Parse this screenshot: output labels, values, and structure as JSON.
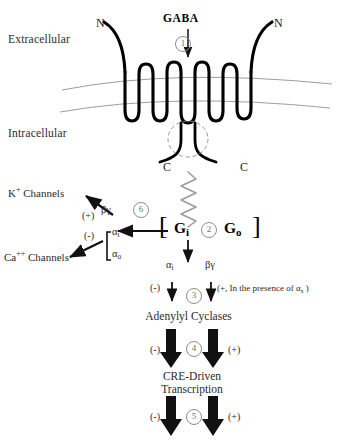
{
  "figure": {
    "type": "signaling-pathway-diagram"
  },
  "compartments": {
    "extracellular_label": "Extracellular",
    "intracellular_label": "Intracellular"
  },
  "ligand": {
    "name": "GABA"
  },
  "receptor": {
    "n_terminus_left": "N",
    "n_terminus_right": "N",
    "c_terminus_left": "C",
    "c_terminus_right": "C",
    "transmembrane_helices": 7
  },
  "gprotein": {
    "bracket_open": "[",
    "bracket_close": "]",
    "left_label": "G",
    "left_subscript": "i",
    "right_label": "G",
    "right_subscript": "o"
  },
  "channels": {
    "potassium": {
      "name": "K",
      "charge": "+",
      "suffix": " Channels",
      "full": "K+ Channels",
      "effect_sign": "(+)",
      "mediator": "βγ"
    },
    "calcium": {
      "name": "Ca",
      "charge": "++",
      "suffix": " Channels",
      "full": "Ca++ Channels",
      "effect_sign": "(-)",
      "mediator_alpha_i": "α",
      "mediator_alpha_i_sub": "i",
      "mediator_alpha_o": "α",
      "mediator_alpha_o_sub": "o"
    }
  },
  "cascade": {
    "alpha_i": {
      "symbol": "α",
      "sub": "i"
    },
    "beta_gamma": {
      "symbol": "βγ"
    },
    "alpha_i_sign": "(-)",
    "beta_gamma_note": "(+, In the presence of α",
    "beta_gamma_note_sub": "s",
    "beta_gamma_note_close": " )",
    "adenylyl_cyclases": "Adenylyl Cyclases",
    "ac_left_sign": "(-)",
    "ac_right_sign": "(+)",
    "cre_line1": "CRE-Driven",
    "cre_line2": "Transcription",
    "cre_left_sign": "(-)",
    "cre_right_sign": "(+)"
  },
  "steps": [
    {
      "id": "1",
      "label": "1"
    },
    {
      "id": "2",
      "label": "2"
    },
    {
      "id": "3",
      "label": "3"
    },
    {
      "id": "4",
      "label": "4"
    },
    {
      "id": "5",
      "label": "5"
    },
    {
      "id": "6",
      "label": "6"
    }
  ],
  "colors": {
    "ink": "#000000",
    "text": "#2b2b2b",
    "membrane": "#999999",
    "squiggle": "#9a9a9a",
    "step_badge": "#8d8d8d",
    "background": "#ffffff"
  }
}
